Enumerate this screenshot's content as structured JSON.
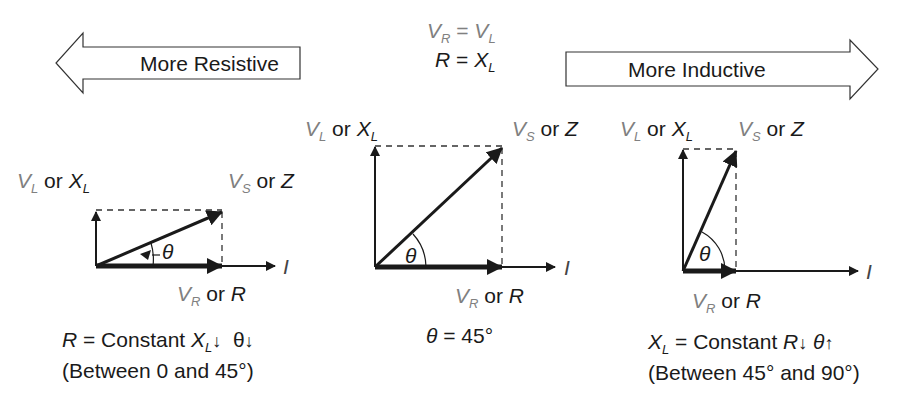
{
  "header": {
    "left_arrow_label": "More Resistive",
    "right_arrow_label": "More Inductive",
    "eq1": {
      "lhs_sym": "V",
      "lhs_sub": "R",
      "op": "=",
      "rhs_sym": "V",
      "rhs_sub": "L"
    },
    "eq2": {
      "lhs_sym": "R",
      "op": "=",
      "rhs_sym": "X",
      "rhs_sub": "L"
    }
  },
  "labels": {
    "vl_sym": "V",
    "vl_sub": "L",
    "or": "or",
    "xl_sym": "X",
    "xl_sub": "L",
    "vs_sym": "V",
    "vs_sub": "S",
    "z_sym": "Z",
    "vr_sym": "V",
    "vr_sub": "R",
    "r_sym": "R",
    "i_sym": "I",
    "theta": "θ"
  },
  "panels": [
    {
      "id": "resistive",
      "angle_deg": 22,
      "caption_line1": {
        "r": "R",
        "eq": " = Constant ",
        "x": "X",
        "xsub": "L",
        "arrow1": "↓",
        "theta": "θ",
        "arrow2": "↓"
      },
      "caption_line2": "(Between 0 and 45°)"
    },
    {
      "id": "balanced",
      "angle_deg": 45,
      "caption_line1": {
        "theta": "θ",
        "eq": " = 45°"
      }
    },
    {
      "id": "inductive",
      "angle_deg": 64,
      "caption_line1": {
        "x": "X",
        "xsub": "L",
        "eq": " = Constant ",
        "r": "R",
        "arrow1": "↓",
        "theta": "θ",
        "arrow2": "↑"
      },
      "caption_line2": "(Between 45° and 90°)"
    }
  ],
  "colors": {
    "line": "#1a1a1a",
    "voltage_label": "#808080",
    "background": "#ffffff"
  }
}
